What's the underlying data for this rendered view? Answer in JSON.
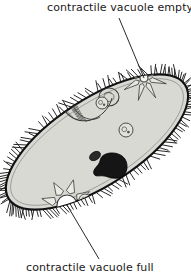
{
  "figure": {
    "view_width": 191,
    "view_height": 276,
    "background_color": "#ffffff"
  },
  "labels": [
    {
      "id": "top",
      "text": "contractile vacuole empty",
      "x": 47,
      "y": 2,
      "leader_from": [
        119,
        18
      ],
      "leader_to": [
        144,
        78
      ]
    },
    {
      "id": "bottom",
      "text": "contractile vacuole full",
      "x": 26,
      "y": 262,
      "leader_from": [
        99,
        259
      ],
      "leader_to": [
        67,
        205
      ]
    }
  ],
  "colors": {
    "outline": "#111111",
    "cytoplasm": "#d9d9d4",
    "cytoplasm_edge": "#cfcfca",
    "cilia": "#1c1c1c",
    "macronucleus": "#151515",
    "micronucleus": "#2a2a2a",
    "vacuole_full_fill": "#ffffff",
    "vacuole_empty_fill": "#f2f2ee",
    "organelle_stroke": "#3a3a3a",
    "label_text": "#1a1a1a",
    "leader_line": "#2a2a2a"
  },
  "body": {
    "name": "paramecium-cell-body",
    "center": [
      97,
      142
    ],
    "length": 210,
    "width": 86,
    "tilt_degrees": -33,
    "cilia_count": 150,
    "cilia_length": 9
  },
  "organelles": [
    {
      "name": "contractile-vacuole-empty",
      "type": "star-vacuole",
      "state": "empty",
      "center": [
        144,
        78
      ],
      "core_radius": 4,
      "canal_count": 8,
      "canal_length": 19
    },
    {
      "name": "contractile-vacuole-full",
      "type": "star-vacuole",
      "state": "full",
      "center": [
        67,
        205
      ],
      "core_radius": 10,
      "canal_count": 8,
      "canal_length": 16
    },
    {
      "name": "macronucleus",
      "type": "nucleus",
      "center": [
        110,
        165
      ],
      "rx": 17,
      "ry": 12,
      "rotation": -32
    },
    {
      "name": "micronucleus",
      "type": "nucleus",
      "center": [
        95,
        158
      ],
      "rx": 6,
      "ry": 4,
      "rotation": -32
    },
    {
      "name": "oral-groove",
      "type": "groove",
      "mouth": [
        70,
        101
      ],
      "gullet_end": [
        95,
        117
      ]
    },
    {
      "name": "food-vacuole-1",
      "type": "food-vacuole",
      "center": [
        147,
        52
      ],
      "radius": 7
    },
    {
      "name": "food-vacuole-2",
      "type": "food-vacuole",
      "center": [
        102,
        103
      ],
      "radius": 6
    },
    {
      "name": "food-vacuole-3",
      "type": "food-vacuole",
      "center": [
        126,
        130
      ],
      "radius": 7
    },
    {
      "name": "food-vacuole-4",
      "type": "food-vacuole",
      "center": [
        85,
        200
      ],
      "radius": 6
    },
    {
      "name": "food-vacuole-5",
      "type": "food-vacuole",
      "center": [
        39,
        240
      ],
      "radius": 5
    }
  ]
}
